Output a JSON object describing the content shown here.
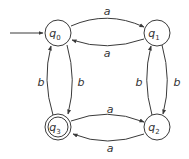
{
  "diagram": {
    "type": "finite-automaton",
    "start_state": "q0",
    "accept_states": [
      "q3"
    ],
    "states": [
      {
        "id": "q0",
        "name": "q",
        "sub": "0",
        "cx": 58,
        "cy": 33,
        "accepting": false
      },
      {
        "id": "q1",
        "name": "q",
        "sub": "1",
        "cx": 157,
        "cy": 33,
        "accepting": false
      },
      {
        "id": "q2",
        "name": "q",
        "sub": "2",
        "cx": 157,
        "cy": 127,
        "accepting": false
      },
      {
        "id": "q3",
        "name": "q",
        "sub": "3",
        "cx": 58,
        "cy": 127,
        "accepting": true
      }
    ],
    "transitions": [
      {
        "from": "q0",
        "to": "q1",
        "label": "a"
      },
      {
        "from": "q1",
        "to": "q0",
        "label": "a"
      },
      {
        "from": "q3",
        "to": "q2",
        "label": "a"
      },
      {
        "from": "q2",
        "to": "q3",
        "label": "a"
      },
      {
        "from": "q0",
        "to": "q3",
        "label": "b"
      },
      {
        "from": "q3",
        "to": "q0",
        "label": "b"
      },
      {
        "from": "q1",
        "to": "q2",
        "label": "b"
      },
      {
        "from": "q2",
        "to": "q1",
        "label": "b"
      }
    ],
    "edge_labels": {
      "q0_q1": "a",
      "q1_q0": "a",
      "q3_q2": "a",
      "q2_q3": "a",
      "q0_q3": "b",
      "q3_q0": "b",
      "q1_q2": "b",
      "q2_q1": "b"
    },
    "labels": {
      "q0": {
        "name": "q",
        "sub": "0"
      },
      "q1": {
        "name": "q",
        "sub": "1"
      },
      "q2": {
        "name": "q",
        "sub": "2"
      },
      "q3": {
        "name": "q",
        "sub": "3"
      }
    }
  }
}
